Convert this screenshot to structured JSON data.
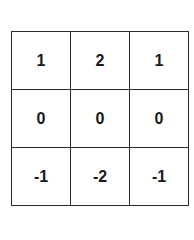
{
  "matrix": {
    "label": "3x3 kernel",
    "rows": [
      [
        "1",
        "2",
        "1"
      ],
      [
        "0",
        "0",
        "0"
      ],
      [
        "-1",
        "-2",
        "-1"
      ]
    ]
  },
  "colors": {
    "border": "#2a2a2a",
    "text": "#1a1a1a",
    "background": "#ffffff"
  }
}
